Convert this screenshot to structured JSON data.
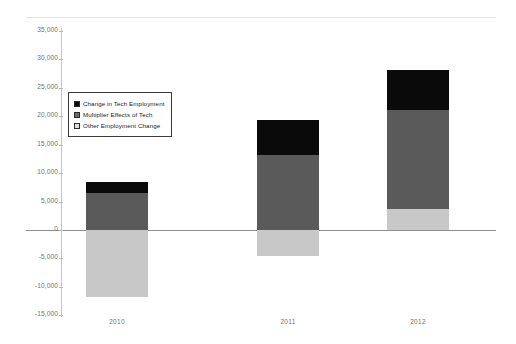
{
  "top_caption": "",
  "chart_data": {
    "type": "bar",
    "subtype": "stacked-column",
    "title": "",
    "xlabel": "",
    "ylabel": "",
    "categories": [
      "2010",
      "2011",
      "2012"
    ],
    "series": [
      {
        "name": "Change in Tech Employment",
        "color": "#0a0a0a",
        "values": [
          2000,
          6200,
          7000
        ]
      },
      {
        "name": "Multiplier Effects of Tech",
        "color": "#5a5a5a",
        "values": [
          6500,
          13200,
          17400
        ]
      },
      {
        "name": "Other Employment Change",
        "color": "#c8c8c8",
        "values": [
          -11800,
          -4500,
          3700
        ]
      }
    ],
    "stack_totals_positive": [
      8500,
      19400,
      28100
    ],
    "ylim": [
      -15000,
      35000
    ],
    "ytick_values": [
      35000,
      30000,
      25000,
      20000,
      15000,
      10000,
      5000,
      0,
      -5000,
      -10000,
      -15000
    ],
    "ytick_labels": [
      "35,000",
      "30,000",
      "25,000",
      "20,000",
      "15,000",
      "10,000",
      "5,000",
      "0",
      "-5,000",
      "-10,000",
      "-15,000"
    ],
    "grid": false,
    "legend_position": "inside-upper-left"
  },
  "legend": {
    "items": [
      {
        "label": "Change in Tech Employment",
        "swatch": "tech"
      },
      {
        "label": "Multiplier Effects of Tech",
        "swatch": "mult"
      },
      {
        "label": "Other Employment Change",
        "swatch": "other"
      }
    ]
  }
}
